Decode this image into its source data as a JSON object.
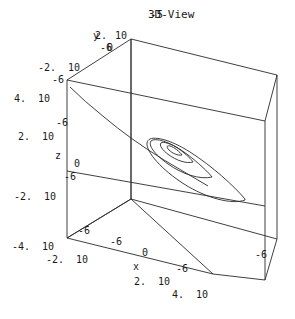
{
  "plot": {
    "title": "3D-View",
    "title_overlay": "-5",
    "background_color": "#ffffff",
    "line_color": "#2a2a2a",
    "text_color": "#1a1a1a",
    "axis_names": {
      "x": "x",
      "y": "y",
      "z": "z"
    },
    "labels": [
      {
        "name": "title",
        "text": "3D-View",
        "x": 148,
        "y": 9,
        "kind": "title"
      },
      {
        "name": "title-overlap",
        "text": "-5",
        "x": 150,
        "y": 9,
        "kind": "title"
      },
      {
        "name": "axis-name-y",
        "text": "y",
        "x": 93,
        "y": 31,
        "kind": "axname"
      },
      {
        "name": "ytick-2",
        "text": "2.",
        "x": 95,
        "y": 31,
        "kind": "tick"
      },
      {
        "name": "ytick-10",
        "text": "10",
        "x": 115,
        "y": 31,
        "kind": "tick"
      },
      {
        "name": "ytick-neg6",
        "text": "-6",
        "x": 100,
        "y": 43,
        "kind": "tick"
      },
      {
        "name": "ytick-0",
        "text": "0",
        "x": 107,
        "y": 43,
        "kind": "tick"
      },
      {
        "name": "ytick-neg2",
        "text": "-2.",
        "x": 38,
        "y": 63,
        "kind": "tick"
      },
      {
        "name": "ytick-10-b",
        "text": "10",
        "x": 68,
        "y": 63,
        "kind": "tick"
      },
      {
        "name": "ytick-neg6-b",
        "text": "-6",
        "x": 52,
        "y": 75,
        "kind": "tick"
      },
      {
        "name": "ztick-4",
        "text": "4.",
        "x": 14,
        "y": 94,
        "kind": "tick"
      },
      {
        "name": "ztick-10-a",
        "text": "10",
        "x": 38,
        "y": 94,
        "kind": "tick"
      },
      {
        "name": "ztick-neg6-a",
        "text": "-6",
        "x": 56,
        "y": 118,
        "kind": "tick"
      },
      {
        "name": "ztick-2",
        "text": "2.",
        "x": 18,
        "y": 132,
        "kind": "tick"
      },
      {
        "name": "ztick-10-b",
        "text": "10",
        "x": 42,
        "y": 132,
        "kind": "tick"
      },
      {
        "name": "axis-name-z",
        "text": "z",
        "x": 55,
        "y": 151,
        "kind": "axname"
      },
      {
        "name": "ztick-0",
        "text": "0",
        "x": 74,
        "y": 159,
        "kind": "tick"
      },
      {
        "name": "ztick-neg6-b",
        "text": "-6",
        "x": 64,
        "y": 172,
        "kind": "tick"
      },
      {
        "name": "ztick-neg2",
        "text": "-2.",
        "x": 14,
        "y": 192,
        "kind": "tick"
      },
      {
        "name": "ztick-10-c",
        "text": "10",
        "x": 44,
        "y": 192,
        "kind": "tick"
      },
      {
        "name": "xtick-neg6-a",
        "text": "-6",
        "x": 78,
        "y": 226,
        "kind": "tick"
      },
      {
        "name": "xtick-neg4",
        "text": "-4.",
        "x": 12,
        "y": 242,
        "kind": "tick"
      },
      {
        "name": "xtick-10-a",
        "text": "10",
        "x": 42,
        "y": 242,
        "kind": "tick"
      },
      {
        "name": "xtick-neg2",
        "text": "-2.",
        "x": 46,
        "y": 255,
        "kind": "tick"
      },
      {
        "name": "xtick-10-b",
        "text": "10",
        "x": 76,
        "y": 255,
        "kind": "tick"
      },
      {
        "name": "xtick-0",
        "text": "0",
        "x": 142,
        "y": 248,
        "kind": "tick"
      },
      {
        "name": "axis-name-x",
        "text": "x",
        "x": 133,
        "y": 262,
        "kind": "axname"
      },
      {
        "name": "xtick-neg6-b",
        "text": "-6",
        "x": 176,
        "y": 264,
        "kind": "tick"
      },
      {
        "name": "xtick-2",
        "text": "2.",
        "x": 134,
        "y": 277,
        "kind": "tick"
      },
      {
        "name": "xtick-10-c",
        "text": "10",
        "x": 158,
        "y": 277,
        "kind": "tick"
      },
      {
        "name": "xtick-4",
        "text": "4.",
        "x": 172,
        "y": 290,
        "kind": "tick"
      },
      {
        "name": "xtick-10-d",
        "text": "10",
        "x": 196,
        "y": 290,
        "kind": "tick"
      },
      {
        "name": "xtick-neg6-c",
        "text": "-6",
        "x": 255,
        "y": 250,
        "kind": "tick"
      },
      {
        "name": "ztick-neg6-c",
        "text": "-6",
        "x": 110,
        "y": 237,
        "kind": "tick"
      }
    ]
  },
  "chart_data": {
    "type": "line",
    "title": "3D-View",
    "projection": "3d-wireframe-box",
    "xlabel": "x",
    "ylabel": "y",
    "zlabel": "z",
    "x_ticks": [
      "-4. 10",
      "-2. 10",
      "0",
      "2. 10",
      "4. 10"
    ],
    "y_ticks": [
      "-2. 10",
      "2. 10",
      "-6",
      "0"
    ],
    "z_ticks": [
      "-2. 10",
      "2. 10",
      "4. 10",
      "-6",
      "0"
    ],
    "axis_tick_marks": [
      "-6",
      "0",
      "-6"
    ],
    "series": [
      {
        "name": "spiral-curve",
        "description": "elongated elliptical spiral in the interior of the box"
      },
      {
        "name": "tail-curve",
        "description": "long arc running from upper-left wall down to the spiral centre"
      }
    ],
    "box": {
      "description": "wireframe cuboid with interior coordinate axes crossing near centre"
    },
    "grid": false,
    "legend": false
  }
}
